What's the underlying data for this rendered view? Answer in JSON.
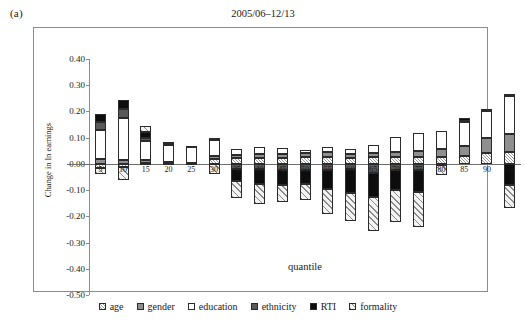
{
  "panel_label": "(a)",
  "chart_data": {
    "type": "bar",
    "subtype": "stacked-bar-diverging",
    "title": "2005/06–12/13",
    "xlabel": "quantile",
    "ylabel": "Change in ln earnings",
    "ylim": [
      -0.5,
      0.4
    ],
    "ytick_labels": [
      "0.40",
      "0.30",
      "0.20",
      "0.10",
      "0.00",
      "-0.10",
      "-0.20",
      "-0.30",
      "-0.40",
      "-0.50"
    ],
    "ytick_values": [
      0.4,
      0.3,
      0.2,
      0.1,
      0.0,
      -0.1,
      -0.2,
      -0.3,
      -0.4,
      -0.5
    ],
    "grid": false,
    "legend_position": "bottom",
    "categories": [
      "5",
      "10",
      "15",
      "20",
      "25",
      "30",
      "35",
      "40",
      "45",
      "50",
      "55",
      "60",
      "65",
      "70",
      "75",
      "80",
      "85",
      "90",
      "95"
    ],
    "series": [
      {
        "name": "age",
        "fill": "light-hatch",
        "values": [
          -0.015,
          -0.012,
          0.005,
          0.004,
          0.003,
          0.02,
          0.022,
          0.023,
          0.024,
          0.025,
          0.026,
          0.024,
          0.027,
          0.027,
          0.026,
          0.027,
          0.03,
          0.042,
          0.045
        ]
      },
      {
        "name": "gender",
        "fill": "mid-gray",
        "values": [
          0.02,
          0.016,
          0.008,
          0.002,
          0.002,
          0.01,
          0.012,
          0.014,
          0.014,
          0.015,
          0.018,
          0.012,
          0.016,
          0.02,
          0.022,
          0.03,
          0.038,
          0.055,
          0.07
        ]
      },
      {
        "name": "education",
        "fill": "white",
        "values": [
          0.11,
          0.16,
          0.075,
          0.068,
          0.062,
          0.062,
          0.024,
          0.026,
          0.022,
          0.014,
          0.022,
          0.02,
          0.03,
          0.055,
          0.07,
          0.07,
          0.09,
          0.105,
          0.145
        ]
      },
      {
        "name": "ethnicity",
        "fill": "dark-gray",
        "values": [
          0.028,
          0.032,
          0.012,
          0.003,
          0.002,
          0.008,
          -0.018,
          -0.02,
          -0.022,
          -0.022,
          -0.024,
          -0.02,
          -0.035,
          -0.022,
          -0.025,
          -0.004,
          0.006,
          0.008,
          0.006
        ]
      },
      {
        "name": "RTI",
        "fill": "black",
        "values": [
          0.032,
          0.035,
          0.022,
          0.005,
          0.0,
          0.0,
          -0.048,
          -0.058,
          -0.06,
          -0.055,
          -0.072,
          -0.092,
          -0.09,
          -0.078,
          -0.082,
          0.0,
          0.012,
          0.0,
          -0.08
        ]
      },
      {
        "name": "formality",
        "fill": "diagonal-hatch",
        "values": [
          -0.022,
          -0.05,
          0.024,
          0.0,
          0.0,
          -0.04,
          -0.065,
          -0.075,
          -0.062,
          -0.06,
          -0.096,
          -0.105,
          -0.13,
          -0.122,
          -0.132,
          -0.04,
          0.0,
          0.0,
          -0.09
        ]
      }
    ],
    "legend_entries": [
      {
        "label": "age",
        "fill": "light-hatch"
      },
      {
        "label": "gender",
        "fill": "mid-gray"
      },
      {
        "label": "education",
        "fill": "white"
      },
      {
        "label": "ethnicity",
        "fill": "dark-gray"
      },
      {
        "label": "RTI",
        "fill": "black"
      },
      {
        "label": "formality",
        "fill": "diagonal-hatch"
      }
    ],
    "colors": {
      "age": "#9a9a9a",
      "gender": "#8f8f8f",
      "education": "#ffffff",
      "ethnicity": "#595959",
      "rti": "#0d0d0d",
      "formality": "#8a8a8a",
      "axis": "#8c8c8c",
      "zero_line": "#6e6e6e",
      "outline": "#2b2b2b"
    }
  }
}
